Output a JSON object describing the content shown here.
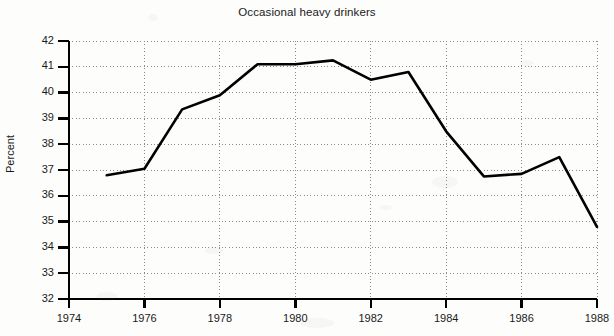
{
  "chart_data": {
    "type": "line",
    "title": "Occasional heavy drinkers",
    "xlabel": "",
    "ylabel": "Percent",
    "xlim": [
      1974,
      1988
    ],
    "ylim": [
      32,
      42
    ],
    "grid": true,
    "legend": "none",
    "x_ticks": [
      1974,
      1976,
      1978,
      1980,
      1982,
      1984,
      1986,
      1988
    ],
    "x_tick_labels": [
      "1974",
      "1976",
      "1978",
      "1980",
      "1982",
      "1984",
      "1986",
      "1988"
    ],
    "y_ticks": [
      32,
      33,
      34,
      35,
      36,
      37,
      38,
      39,
      40,
      41,
      42
    ],
    "y_tick_labels": [
      "32",
      "33",
      "34",
      "35",
      "36",
      "37",
      "38",
      "39",
      "40",
      "41",
      "42"
    ],
    "x": [
      1975,
      1976,
      1977,
      1978,
      1979,
      1980,
      1981,
      1982,
      1983,
      1984,
      1985,
      1986,
      1987,
      1988
    ],
    "values": [
      36.8,
      37.05,
      39.35,
      39.9,
      41.1,
      41.1,
      41.25,
      40.5,
      40.8,
      38.5,
      36.75,
      36.85,
      37.5,
      34.8
    ],
    "series": [
      {
        "name": "Occasional heavy drinkers",
        "color": "#000000",
        "values": [
          36.8,
          37.05,
          39.35,
          39.9,
          41.1,
          41.1,
          41.25,
          40.5,
          40.8,
          38.5,
          36.75,
          36.85,
          37.5,
          34.8
        ]
      }
    ],
    "line_color": "#000000",
    "grid_color": "#8a8a8a",
    "axis_color": "#000000",
    "background_color": "#fdfdfc"
  }
}
